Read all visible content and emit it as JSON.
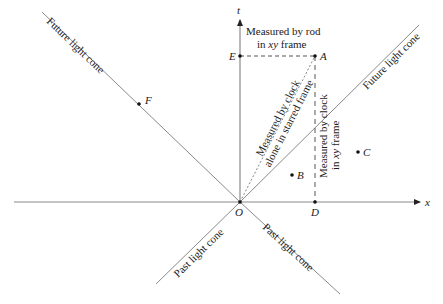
{
  "diagram": {
    "type": "spacetime-diagram",
    "axes": {
      "x_label": "x",
      "t_label": "t"
    },
    "origin_label": "O",
    "points": [
      {
        "id": "A",
        "label": "A"
      },
      {
        "id": "B",
        "label": "B"
      },
      {
        "id": "C",
        "label": "C"
      },
      {
        "id": "D",
        "label": "D"
      },
      {
        "id": "E",
        "label": "E"
      },
      {
        "id": "F",
        "label": "F"
      }
    ],
    "cone_labels": {
      "future_left": "Future light cone",
      "future_right": "Future light cone",
      "past_left": "Past light cone",
      "past_right": "Past light cone"
    },
    "annotations": {
      "rod_line1": "Measured by rod",
      "rod_line2_pre": "in ",
      "rod_line2_em": "xy",
      "rod_line2_post": " frame",
      "clock_starred_line1": "Measured by clock",
      "clock_starred_line2": "alone in starred frame",
      "clock_xy_line1": "Measured by clock",
      "clock_xy_line2_pre": "in ",
      "clock_xy_line2_em": "xy",
      "clock_xy_line2_post": " frame"
    },
    "colors": {
      "line": "#8a8a8a",
      "axis": "#7a7a7a",
      "point": "#111111",
      "text": "#1a1a1a"
    }
  }
}
